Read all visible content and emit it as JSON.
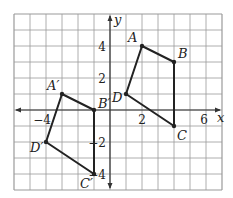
{
  "diagram": {
    "grid": {
      "x_min": -6,
      "x_max": 7,
      "y_min": -5,
      "y_max": 6,
      "origin_px": [
        110,
        110
      ],
      "cell_px": 16,
      "line_color": "#9a9a9a",
      "border_color": "#8a8a8a"
    },
    "axes": {
      "x_label": "x",
      "y_label": "y",
      "color": "#333333"
    },
    "tick_labels": [
      {
        "text": "4",
        "x": -1,
        "y": 4,
        "axis": "y"
      },
      {
        "text": "2",
        "x": -1,
        "y": 2,
        "axis": "y"
      },
      {
        "text": "−2",
        "x": -1,
        "y": -2,
        "axis": "y"
      },
      {
        "text": "−4",
        "x": -1,
        "y": -4,
        "axis": "y"
      },
      {
        "text": "−4",
        "x": -4,
        "y": 0,
        "axis": "x"
      },
      {
        "text": "2",
        "x": 2,
        "y": 0,
        "axis": "x"
      },
      {
        "text": "6",
        "x": 6,
        "y": 0,
        "axis": "x"
      }
    ],
    "shapes": [
      {
        "name": "ABCD",
        "color": "#222222",
        "points": [
          {
            "label": "A",
            "x": 2,
            "y": 4
          },
          {
            "label": "B",
            "x": 4,
            "y": 3
          },
          {
            "label": "C",
            "x": 4,
            "y": -1
          },
          {
            "label": "D",
            "x": 1,
            "y": 1
          }
        ]
      },
      {
        "name": "A'B'C'D'",
        "color": "#222222",
        "points": [
          {
            "label": "A′",
            "x": -3,
            "y": 1
          },
          {
            "label": "B′",
            "x": -1,
            "y": 0
          },
          {
            "label": "C′",
            "x": -1,
            "y": -4
          },
          {
            "label": "D′",
            "x": -4,
            "y": -2
          }
        ]
      }
    ]
  }
}
